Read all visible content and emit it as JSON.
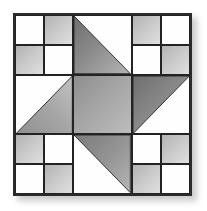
{
  "image": {
    "subject": "quilt-block-diagram",
    "title": "Pinwheel Star Quilt Block",
    "background_color": "#ffffff"
  },
  "block": {
    "name": "quilt-block",
    "grid_rows": 3,
    "grid_columns": 3,
    "border_color": "#2b2b2b",
    "seam_color": "#232323",
    "shadow_color": "#b9b9b9",
    "colors": {
      "white_patch": "#fefefe",
      "light_gray_patch": "#c8c8c8",
      "light_gray_highlight": "#e0e0e0",
      "light_gray_shade": "#b3b3b3",
      "blade_gray": "#8a8a8a",
      "blade_gray_highlight": "#b5b5b5",
      "blade_gray_shade": "#6f6f6f",
      "center_gray": "#a2a2a2",
      "center_gray_highlight": "#bdbdbd",
      "center_gray_shade": "#8e8e8e"
    },
    "units": [
      {
        "position": "top-left",
        "type": "four-patch",
        "patches": [
          "white",
          "gray",
          "gray",
          "white"
        ]
      },
      {
        "position": "top-center",
        "type": "blade-triangle",
        "triangle": "lower-left",
        "fill": "blade_gray"
      },
      {
        "position": "top-right",
        "type": "four-patch",
        "patches": [
          "gray",
          "white",
          "white",
          "gray"
        ]
      },
      {
        "position": "middle-left",
        "type": "blade-triangle",
        "triangle": "lower-right",
        "fill": "blade_gray"
      },
      {
        "position": "center",
        "type": "solid-square",
        "fill": "center_gray"
      },
      {
        "position": "middle-right",
        "type": "blade-triangle",
        "triangle": "upper-left",
        "fill": "blade_gray"
      },
      {
        "position": "bottom-left",
        "type": "four-patch",
        "patches": [
          "gray",
          "white",
          "white",
          "gray"
        ]
      },
      {
        "position": "bottom-center",
        "type": "blade-triangle",
        "triangle": "upper-right",
        "fill": "blade_gray"
      },
      {
        "position": "bottom-right",
        "type": "four-patch",
        "patches": [
          "white",
          "gray",
          "gray",
          "white"
        ]
      }
    ]
  }
}
